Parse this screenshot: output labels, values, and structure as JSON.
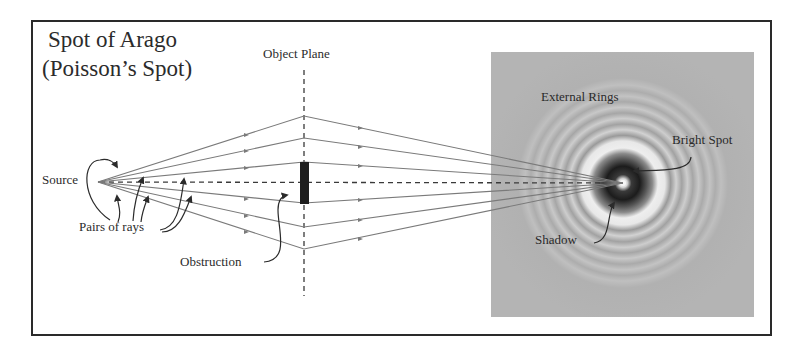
{
  "title": {
    "line1": "Spot of Arago",
    "line2": "(Poisson’s Spot)"
  },
  "labels": {
    "object_plane": "Object Plane",
    "source": "Source",
    "pairs_of_rays": "Pairs of rays",
    "obstruction": "Obstruction",
    "external_rings": "External Rings",
    "bright_spot": "Bright Spot",
    "shadow": "Shadow"
  },
  "colors": {
    "ray": "#7a7a7a",
    "frame": "#2a2a2a",
    "obstruction": "#1e1e1e",
    "screen_background": "#b4b4b4",
    "text": "#2b2b2b"
  },
  "geometry": {
    "source": [
      98,
      182
    ],
    "object_plane_x": 304,
    "focus_point": [
      623,
      183
    ],
    "ray_plane_y": [
      116,
      138,
      162,
      203,
      227,
      249
    ],
    "obstruction": {
      "x": 300,
      "y": 162,
      "w": 9,
      "h": 42
    },
    "screen": {
      "x": 491,
      "y": 52,
      "w": 263,
      "h": 265
    }
  }
}
